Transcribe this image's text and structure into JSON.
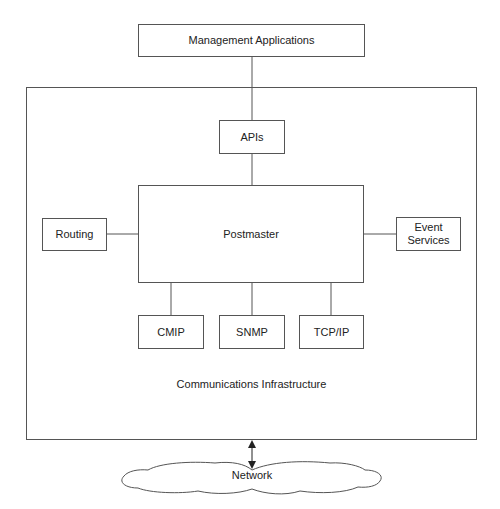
{
  "diagram": {
    "top_box": {
      "label": "Management Applications"
    },
    "container": {
      "label": "Communications Infrastructure"
    },
    "apis": {
      "label": "APIs"
    },
    "postmaster": {
      "label": "Postmaster"
    },
    "routing": {
      "label": "Routing"
    },
    "event_services": {
      "label": "Event\nServices",
      "line1": "Event",
      "line2": "Services"
    },
    "protocols": [
      {
        "label": "CMIP"
      },
      {
        "label": "SNMP"
      },
      {
        "label": "TCP/IP"
      }
    ],
    "network": {
      "label": "Network",
      "shape": "cloud"
    },
    "connections": [
      "Management Applications - APIs",
      "APIs - Postmaster",
      "Routing - Postmaster",
      "Postmaster - Event Services",
      "Postmaster - CMIP",
      "Postmaster - SNMP",
      "Postmaster - TCP/IP",
      "Communications Infrastructure <-> Network"
    ],
    "colors": {
      "line": "#555555",
      "text": "#222222",
      "background": "#ffffff"
    }
  }
}
